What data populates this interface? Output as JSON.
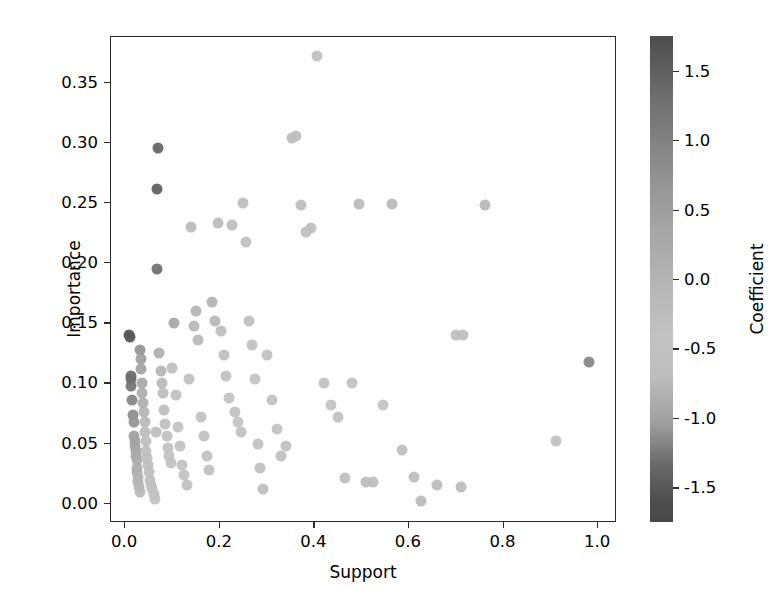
{
  "chart_data": {
    "type": "scatter",
    "title": "",
    "xlabel": "Support",
    "ylabel": "Importance",
    "xlim": [
      -0.03,
      1.04
    ],
    "ylim": [
      -0.016,
      0.388
    ],
    "xticks": [
      "0.0",
      "0.2",
      "0.4",
      "0.6",
      "0.8",
      "1.0"
    ],
    "xtick_values": [
      0.0,
      0.2,
      0.4,
      0.6,
      0.8,
      1.0
    ],
    "yticks": [
      "0.00",
      "0.05",
      "0.10",
      "0.15",
      "0.20",
      "0.25",
      "0.30",
      "0.35"
    ],
    "ytick_values": [
      0.0,
      0.05,
      0.1,
      0.15,
      0.2,
      0.25,
      0.3,
      0.35
    ],
    "grid": false,
    "legend": null,
    "marker_size_px": 11,
    "colormap": "grayscale-diverging",
    "colorbar": {
      "label": "Coefficient",
      "ticks": [
        "1.5",
        "1.0",
        "0.5",
        "0.0",
        "-0.5",
        "-1.0",
        "-1.5"
      ],
      "tick_values": [
        1.5,
        1.0,
        0.5,
        0.0,
        -0.5,
        -1.0,
        -1.5
      ],
      "vmin": -1.75,
      "vmax": 1.75,
      "position": "right",
      "orientation": "vertical",
      "gradient_stops": [
        "#4d4d4d",
        "#8e8e8e",
        "#b7b7b7",
        "#c2c2c2",
        "#9d9d9d",
        "#505050"
      ]
    },
    "series": [
      {
        "name": "rules",
        "x": [
          0.008,
          0.01,
          0.012,
          0.013,
          0.013,
          0.015,
          0.016,
          0.018,
          0.018,
          0.02,
          0.021,
          0.022,
          0.023,
          0.024,
          0.025,
          0.026,
          0.027,
          0.028,
          0.03,
          0.031,
          0.032,
          0.033,
          0.034,
          0.035,
          0.036,
          0.038,
          0.04,
          0.041,
          0.042,
          0.044,
          0.045,
          0.047,
          0.049,
          0.051,
          0.053,
          0.055,
          0.057,
          0.06,
          0.062,
          0.065,
          0.067,
          0.068,
          0.07,
          0.072,
          0.075,
          0.078,
          0.08,
          0.082,
          0.085,
          0.088,
          0.09,
          0.093,
          0.096,
          0.1,
          0.104,
          0.108,
          0.112,
          0.116,
          0.12,
          0.125,
          0.13,
          0.135,
          0.14,
          0.145,
          0.15,
          0.155,
          0.16,
          0.166,
          0.172,
          0.178,
          0.184,
          0.19,
          0.196,
          0.202,
          0.208,
          0.214,
          0.22,
          0.226,
          0.232,
          0.238,
          0.244,
          0.25,
          0.256,
          0.262,
          0.268,
          0.274,
          0.28,
          0.286,
          0.292,
          0.3,
          0.31,
          0.32,
          0.33,
          0.34,
          0.352,
          0.362,
          0.372,
          0.382,
          0.392,
          0.405,
          0.42,
          0.435,
          0.45,
          0.465,
          0.48,
          0.495,
          0.51,
          0.525,
          0.545,
          0.565,
          0.585,
          0.61,
          0.625,
          0.66,
          0.7,
          0.71,
          0.715,
          0.76,
          0.91,
          0.98
        ],
        "y": [
          0.14,
          0.139,
          0.106,
          0.104,
          0.098,
          0.086,
          0.074,
          0.068,
          0.056,
          0.052,
          0.048,
          0.044,
          0.04,
          0.036,
          0.03,
          0.026,
          0.022,
          0.018,
          0.014,
          0.01,
          0.128,
          0.12,
          0.112,
          0.1,
          0.092,
          0.084,
          0.076,
          0.068,
          0.06,
          0.052,
          0.044,
          0.038,
          0.032,
          0.026,
          0.02,
          0.016,
          0.012,
          0.008,
          0.004,
          0.06,
          0.195,
          0.262,
          0.296,
          0.125,
          0.11,
          0.1,
          0.092,
          0.078,
          0.066,
          0.056,
          0.046,
          0.04,
          0.034,
          0.113,
          0.15,
          0.09,
          0.064,
          0.048,
          0.032,
          0.024,
          0.016,
          0.104,
          0.23,
          0.148,
          0.16,
          0.136,
          0.072,
          0.056,
          0.04,
          0.028,
          0.168,
          0.152,
          0.233,
          0.144,
          0.124,
          0.106,
          0.088,
          0.232,
          0.076,
          0.068,
          0.06,
          0.25,
          0.218,
          0.152,
          0.132,
          0.104,
          0.05,
          0.03,
          0.012,
          0.124,
          0.086,
          0.062,
          0.04,
          0.048,
          0.304,
          0.306,
          0.248,
          0.226,
          0.229,
          0.372,
          0.1,
          0.082,
          0.072,
          0.021,
          0.1,
          0.249,
          0.018,
          0.018,
          0.082,
          0.249,
          0.045,
          0.022,
          0.002,
          0.016,
          0.14,
          0.014,
          0.14,
          0.248,
          0.052,
          0.118
        ],
        "c": [
          -1.55,
          -1.5,
          -1.35,
          -1.3,
          -1.28,
          -1.2,
          -1.15,
          -1.1,
          -1.05,
          -1.0,
          -0.98,
          -0.95,
          -0.92,
          -0.9,
          -0.88,
          -0.85,
          -0.82,
          -0.8,
          -0.78,
          -0.75,
          -1.1,
          -1.05,
          -1.0,
          -0.95,
          -0.9,
          -0.85,
          -0.8,
          -0.75,
          -0.72,
          -0.7,
          -0.68,
          -0.65,
          -0.62,
          -0.6,
          -0.58,
          -0.55,
          -0.52,
          -0.5,
          -0.48,
          -0.7,
          -1.32,
          -1.45,
          -1.4,
          -0.85,
          -0.8,
          -0.75,
          -0.7,
          -0.65,
          -0.6,
          -0.55,
          -0.52,
          -0.5,
          -0.48,
          -0.62,
          -0.95,
          -0.58,
          -0.5,
          -0.45,
          -0.4,
          -0.38,
          -0.35,
          -0.6,
          -0.72,
          -0.78,
          -0.8,
          -0.75,
          -0.45,
          -0.4,
          -0.35,
          -0.32,
          -0.82,
          -0.78,
          -0.72,
          -0.7,
          -0.62,
          -0.55,
          -0.48,
          -0.7,
          -0.45,
          -0.42,
          -0.38,
          -0.68,
          -0.6,
          -0.62,
          -0.55,
          -0.5,
          -0.35,
          -0.3,
          -0.25,
          -0.55,
          -0.45,
          -0.38,
          -0.32,
          -0.35,
          -0.72,
          -0.7,
          -0.68,
          -0.6,
          -0.62,
          -0.6,
          -0.48,
          -0.42,
          -0.4,
          -0.28,
          -0.5,
          -0.72,
          -0.25,
          -0.25,
          -0.42,
          -0.75,
          -0.3,
          -0.26,
          -0.18,
          -0.22,
          -0.62,
          -0.2,
          -0.62,
          -0.78,
          -0.35,
          -1.18
        ]
      }
    ]
  }
}
